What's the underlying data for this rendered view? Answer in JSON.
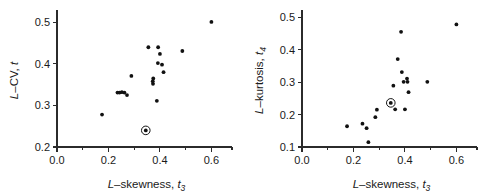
{
  "figure": {
    "panels": [
      "left",
      "right"
    ],
    "background": "#ffffff",
    "marker_color": "#111111"
  },
  "chart_data": [
    {
      "type": "scatter",
      "panel": "left",
      "title": "",
      "xlabel": "L–skewness, t3",
      "ylabel": "L–CV, t",
      "xlabel_parts": {
        "italic1": "L",
        "dash": "–",
        "text": "skewness, ",
        "italic2": "t",
        "sub": "3"
      },
      "ylabel_parts": {
        "italic1": "L",
        "dash": "–",
        "text": "CV, ",
        "italic2": "t",
        "sub": ""
      },
      "xlim": [
        0.0,
        0.68
      ],
      "ylim": [
        0.2,
        0.52
      ],
      "xticks": [
        0.0,
        0.2,
        0.4,
        0.6
      ],
      "xticklabels": [
        "0.0",
        "0.2",
        "0.4",
        "0.6"
      ],
      "xminorticks": [
        0.1,
        0.3,
        0.5
      ],
      "yticks": [
        0.2,
        0.3,
        0.4,
        0.5
      ],
      "yticklabels": [
        "0.2",
        "0.3",
        "0.4",
        "0.5"
      ],
      "grid": false,
      "legend": "none",
      "points": [
        {
          "x": 0.175,
          "y": 0.278
        },
        {
          "x": 0.235,
          "y": 0.331
        },
        {
          "x": 0.243,
          "y": 0.331
        },
        {
          "x": 0.252,
          "y": 0.332
        },
        {
          "x": 0.262,
          "y": 0.331
        },
        {
          "x": 0.272,
          "y": 0.325
        },
        {
          "x": 0.289,
          "y": 0.371
        },
        {
          "x": 0.355,
          "y": 0.44
        },
        {
          "x": 0.372,
          "y": 0.358
        },
        {
          "x": 0.373,
          "y": 0.352
        },
        {
          "x": 0.374,
          "y": 0.365
        },
        {
          "x": 0.388,
          "y": 0.311
        },
        {
          "x": 0.392,
          "y": 0.402
        },
        {
          "x": 0.393,
          "y": 0.44
        },
        {
          "x": 0.4,
          "y": 0.424
        },
        {
          "x": 0.408,
          "y": 0.398
        },
        {
          "x": 0.414,
          "y": 0.38
        },
        {
          "x": 0.487,
          "y": 0.431
        },
        {
          "x": 0.6,
          "y": 0.501
        }
      ],
      "highlighted_point": {
        "x": 0.345,
        "y": 0.24,
        "style": "circled"
      }
    },
    {
      "type": "scatter",
      "panel": "right",
      "title": "",
      "xlabel": "L–skewness, t3",
      "ylabel": "L–kurtosis, t4",
      "xlabel_parts": {
        "italic1": "L",
        "dash": "–",
        "text": "skewness, ",
        "italic2": "t",
        "sub": "3"
      },
      "ylabel_parts": {
        "italic1": "L",
        "dash": "–",
        "text": "kurtosis, ",
        "italic2": "t",
        "sub": "4"
      },
      "xlim": [
        0.0,
        0.68
      ],
      "ylim": [
        0.1,
        0.51
      ],
      "xticks": [
        0.0,
        0.2,
        0.4,
        0.6
      ],
      "xticklabels": [
        "0.0",
        "0.2",
        "0.4",
        "0.6"
      ],
      "xminorticks": [
        0.1,
        0.3,
        0.5
      ],
      "yticks": [
        0.1,
        0.2,
        0.3,
        0.4,
        0.5
      ],
      "yticklabels": [
        "0.1",
        "0.2",
        "0.3",
        "0.4",
        "0.5"
      ],
      "grid": false,
      "legend": "none",
      "points": [
        {
          "x": 0.175,
          "y": 0.164
        },
        {
          "x": 0.235,
          "y": 0.172
        },
        {
          "x": 0.251,
          "y": 0.158
        },
        {
          "x": 0.258,
          "y": 0.115
        },
        {
          "x": 0.285,
          "y": 0.192
        },
        {
          "x": 0.291,
          "y": 0.215
        },
        {
          "x": 0.355,
          "y": 0.289
        },
        {
          "x": 0.362,
          "y": 0.216
        },
        {
          "x": 0.372,
          "y": 0.371
        },
        {
          "x": 0.385,
          "y": 0.455
        },
        {
          "x": 0.388,
          "y": 0.331
        },
        {
          "x": 0.395,
          "y": 0.301
        },
        {
          "x": 0.4,
          "y": 0.216
        },
        {
          "x": 0.408,
          "y": 0.311
        },
        {
          "x": 0.41,
          "y": 0.301
        },
        {
          "x": 0.414,
          "y": 0.269
        },
        {
          "x": 0.487,
          "y": 0.301
        },
        {
          "x": 0.6,
          "y": 0.478
        }
      ],
      "highlighted_point": {
        "x": 0.345,
        "y": 0.236,
        "style": "circled"
      }
    }
  ]
}
